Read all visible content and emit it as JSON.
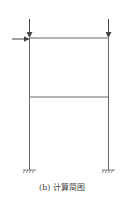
{
  "figure": {
    "caption": "(b) 计算简图",
    "colors": {
      "line": "#555555",
      "text": "#444444"
    },
    "frame": {
      "left_column_x": 29.5,
      "right_column_x": 108.5,
      "top_beam_y": 38,
      "middle_beam_y": 97,
      "base_y": 170,
      "column_top_y": 19
    },
    "loads": [
      {
        "type": "vertical-point-load",
        "location": "top-left joint"
      },
      {
        "type": "vertical-point-load",
        "location": "top-right joint"
      },
      {
        "type": "horizontal-point-load",
        "location": "top-left joint",
        "direction": "right"
      }
    ],
    "supports": [
      {
        "type": "fixed",
        "location": "left base"
      },
      {
        "type": "fixed",
        "location": "right base"
      }
    ]
  }
}
